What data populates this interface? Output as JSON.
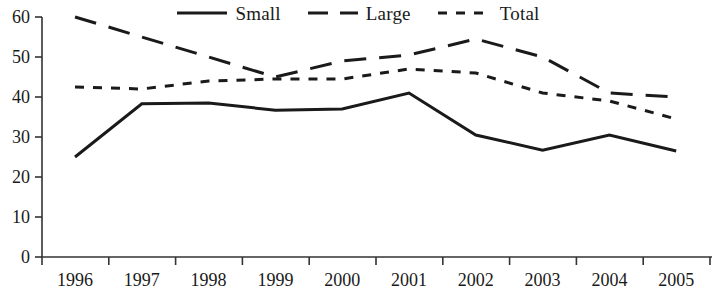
{
  "chart_data": {
    "type": "line",
    "title": "",
    "subtitle": "",
    "xlabel": "",
    "ylabel": "",
    "categories": [
      "1996",
      "1997",
      "1998",
      "1999",
      "2000",
      "2001",
      "2002",
      "2003",
      "2004",
      "2005"
    ],
    "x": [
      1996,
      1997,
      1998,
      1999,
      2000,
      2001,
      2002,
      2003,
      2004,
      2005
    ],
    "ylim": [
      0,
      60
    ],
    "yticks": [
      0,
      10,
      20,
      30,
      40,
      50,
      60
    ],
    "ytick_labels": [
      "0",
      "10",
      "20",
      "30",
      "40",
      "50",
      "60"
    ],
    "grid": false,
    "legend_position": "top-center",
    "series": [
      {
        "name": "Small",
        "style": "solid",
        "color": "#1a1a1a",
        "values": [
          25,
          38.3,
          38.5,
          36.7,
          37,
          41,
          30.5,
          26.7,
          30.5,
          26.5
        ]
      },
      {
        "name": "Large",
        "style": "long-dash",
        "color": "#1a1a1a",
        "values": [
          60,
          55,
          50,
          45,
          49,
          50.5,
          54.5,
          50,
          41,
          40
        ]
      },
      {
        "name": "Total",
        "style": "short-dash",
        "color": "#1a1a1a",
        "values": [
          42.5,
          42,
          44,
          44.5,
          44.5,
          47,
          46,
          41,
          39,
          34.5
        ]
      }
    ]
  },
  "legend": {
    "entries": [
      {
        "label": "Small",
        "style": "solid"
      },
      {
        "label": "Large",
        "style": "long-dash"
      },
      {
        "label": "Total",
        "style": "short-dash"
      }
    ]
  }
}
